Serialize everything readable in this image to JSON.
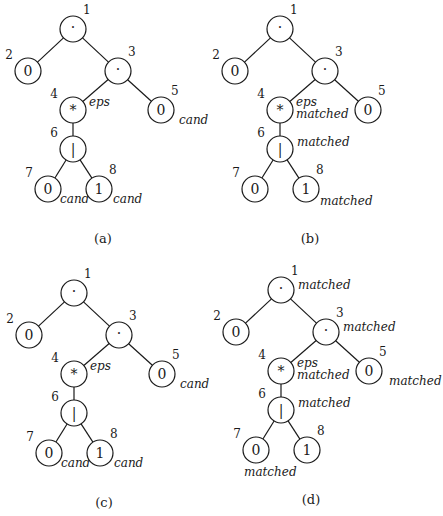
{
  "figure": {
    "node_radius": 13,
    "stroke_color": "#1a1a1a",
    "background": "#ffffff",
    "panels": [
      {
        "id": "a",
        "caption": "(a)",
        "origin": [
          0,
          0
        ],
        "caption_pos": [
          103,
          243
        ],
        "nodes": [
          {
            "n": "1",
            "sym": "·",
            "x": 73,
            "y": 29,
            "ann": []
          },
          {
            "n": "2",
            "sym": "0",
            "x": 28,
            "y": 71,
            "ann": []
          },
          {
            "n": "3",
            "sym": "·",
            "x": 118,
            "y": 71,
            "ann": []
          },
          {
            "n": "4",
            "sym": "*",
            "x": 73,
            "y": 110,
            "ann": [
              {
                "text": "eps",
                "dx": 16,
                "dy": -4
              }
            ]
          },
          {
            "n": "5",
            "sym": "0",
            "x": 161,
            "y": 110,
            "ann": [
              {
                "text": "cand",
                "dx": 18,
                "dy": 14
              }
            ]
          },
          {
            "n": "6",
            "sym": "|",
            "x": 73,
            "y": 149,
            "ann": []
          },
          {
            "n": "7",
            "sym": "0",
            "x": 48,
            "y": 189,
            "ann": [
              {
                "text": "cand",
                "dx": 12,
                "dy": 14
              }
            ]
          },
          {
            "n": "8",
            "sym": "1",
            "x": 99,
            "y": 189,
            "ann": [
              {
                "text": "cand",
                "dx": 14,
                "dy": 14
              }
            ]
          }
        ]
      },
      {
        "id": "b",
        "caption": "(b)",
        "origin": [
          207,
          0
        ],
        "caption_pos": [
          103,
          243
        ],
        "nodes": [
          {
            "n": "1",
            "sym": "·",
            "x": 73,
            "y": 29,
            "ann": []
          },
          {
            "n": "2",
            "sym": "0",
            "x": 28,
            "y": 71,
            "ann": []
          },
          {
            "n": "3",
            "sym": "·",
            "x": 118,
            "y": 71,
            "ann": []
          },
          {
            "n": "4",
            "sym": "*",
            "x": 73,
            "y": 110,
            "ann": [
              {
                "text": "eps",
                "dx": 16,
                "dy": -4
              },
              {
                "text": "matched",
                "dx": 16,
                "dy": 8
              }
            ]
          },
          {
            "n": "5",
            "sym": "0",
            "x": 161,
            "y": 110,
            "ann": []
          },
          {
            "n": "6",
            "sym": "|",
            "x": 73,
            "y": 149,
            "ann": [
              {
                "text": "matched",
                "dx": 17,
                "dy": -3
              }
            ]
          },
          {
            "n": "7",
            "sym": "0",
            "x": 48,
            "y": 189,
            "ann": []
          },
          {
            "n": "8",
            "sym": "1",
            "x": 99,
            "y": 189,
            "ann": [
              {
                "text": "matched",
                "dx": 14,
                "dy": 16
              }
            ]
          }
        ]
      },
      {
        "id": "c",
        "caption": "(c)",
        "origin": [
          1,
          264
        ],
        "caption_pos": [
          103,
          243
        ],
        "nodes": [
          {
            "n": "1",
            "sym": "·",
            "x": 73,
            "y": 29,
            "ann": []
          },
          {
            "n": "2",
            "sym": "0",
            "x": 28,
            "y": 71,
            "ann": []
          },
          {
            "n": "3",
            "sym": "·",
            "x": 118,
            "y": 71,
            "ann": []
          },
          {
            "n": "4",
            "sym": "*",
            "x": 73,
            "y": 110,
            "ann": [
              {
                "text": "eps",
                "dx": 16,
                "dy": -4
              }
            ]
          },
          {
            "n": "5",
            "sym": "0",
            "x": 161,
            "y": 110,
            "ann": [
              {
                "text": "cand",
                "dx": 18,
                "dy": 14
              }
            ]
          },
          {
            "n": "6",
            "sym": "|",
            "x": 73,
            "y": 149,
            "ann": []
          },
          {
            "n": "7",
            "sym": "0",
            "x": 48,
            "y": 189,
            "ann": [
              {
                "text": "cand",
                "dx": 12,
                "dy": 14
              }
            ]
          },
          {
            "n": "8",
            "sym": "1",
            "x": 99,
            "y": 189,
            "ann": [
              {
                "text": "cand",
                "dx": 14,
                "dy": 14
              }
            ]
          }
        ]
      },
      {
        "id": "d",
        "caption": "(d)",
        "origin": [
          208,
          261
        ],
        "caption_pos": [
          103,
          243
        ],
        "nodes": [
          {
            "n": "1",
            "sym": "·",
            "x": 73,
            "y": 29,
            "ann": [
              {
                "text": "matched",
                "dx": 17,
                "dy": -1
              }
            ]
          },
          {
            "n": "2",
            "sym": "0",
            "x": 28,
            "y": 71,
            "ann": []
          },
          {
            "n": "3",
            "sym": "·",
            "x": 118,
            "y": 71,
            "ann": [
              {
                "text": "matched",
                "dx": 17,
                "dy": -1
              }
            ]
          },
          {
            "n": "4",
            "sym": "*",
            "x": 73,
            "y": 110,
            "ann": [
              {
                "text": "eps",
                "dx": 16,
                "dy": -4
              },
              {
                "text": "matched",
                "dx": 16,
                "dy": 8
              }
            ]
          },
          {
            "n": "5",
            "sym": "0",
            "x": 161,
            "y": 110,
            "ann": [
              {
                "text": "matched",
                "dx": 20,
                "dy": 14
              }
            ]
          },
          {
            "n": "6",
            "sym": "|",
            "x": 73,
            "y": 149,
            "ann": [
              {
                "text": "matched",
                "dx": 17,
                "dy": -3
              }
            ]
          },
          {
            "n": "7",
            "sym": "0",
            "x": 48,
            "y": 189,
            "ann": [
              {
                "text": "matched",
                "dx": -12,
                "dy": 26
              }
            ]
          },
          {
            "n": "8",
            "sym": "1",
            "x": 99,
            "y": 189,
            "ann": []
          }
        ]
      }
    ],
    "edges": [
      [
        "1",
        "2"
      ],
      [
        "1",
        "3"
      ],
      [
        "3",
        "4"
      ],
      [
        "3",
        "5"
      ],
      [
        "4",
        "6"
      ],
      [
        "6",
        "7"
      ],
      [
        "6",
        "8"
      ]
    ]
  }
}
